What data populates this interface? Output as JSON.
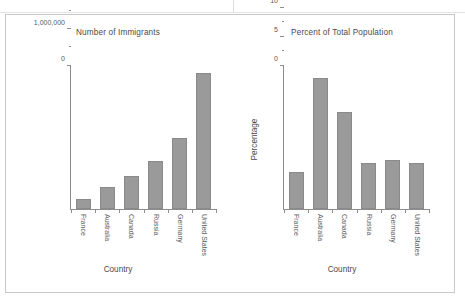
{
  "figure": {
    "panels": [
      {
        "id": "immigrants",
        "title": "Number of Immigrants",
        "xlabel": "Country",
        "ylabel": ""
      },
      {
        "id": "percent",
        "title": "Percent of Total Population",
        "xlabel": "Country",
        "ylabel": "Percentage"
      }
    ]
  },
  "chart_data": [
    {
      "type": "bar",
      "title": "Number of Immigrants",
      "xlabel": "Country",
      "ylabel": "",
      "categories": [
        "France",
        "Australia",
        "Canada",
        "Russia",
        "Germany",
        "United States"
      ],
      "values": [
        280000,
        600000,
        900000,
        1320000,
        1970000,
        3760000
      ],
      "ylim": [
        0,
        4000000
      ],
      "yticks": [
        0,
        1000000,
        2000000,
        3000000,
        4000000
      ],
      "ytick_labels": [
        "0",
        "1,000,000",
        "2,000,000",
        "3,000,000",
        "4,000,000"
      ],
      "yminor_step": 500000,
      "grid": false,
      "legend": "none",
      "bar_color": "#9a9a9a"
    },
    {
      "type": "bar",
      "title": "Percent of Total Population",
      "xlabel": "Country",
      "ylabel": "Percentage",
      "categories": [
        "France",
        "Australia",
        "Canada",
        "Russia",
        "Germany",
        "United States"
      ],
      "values": [
        6.3,
        22.6,
        16.8,
        7.9,
        8.4,
        8.0
      ],
      "ylim": [
        0,
        25
      ],
      "yticks": [
        0,
        5,
        10,
        15,
        20,
        25
      ],
      "ytick_labels": [
        "0",
        "5",
        "10",
        "15",
        "20",
        "25"
      ],
      "yminor_step": 2.5,
      "grid": false,
      "legend": "none",
      "bar_color": "#9a9a9a"
    }
  ]
}
